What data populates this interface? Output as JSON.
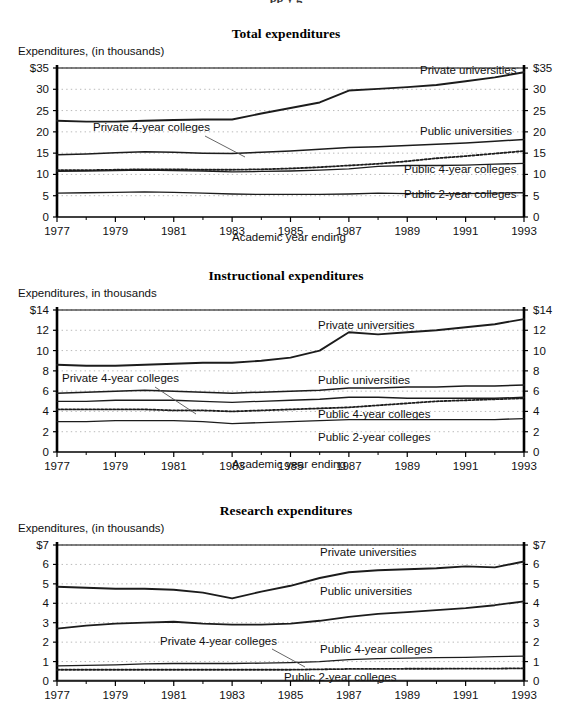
{
  "page": {
    "cut_title": "pp                                 y        g"
  },
  "series_names": {
    "priv_univ": "Private universities",
    "pub_univ": "Public universities",
    "priv4": "Private 4-year colleges",
    "pub4": "Public 4-year colleges",
    "pub2": "Public 2-year colleges"
  },
  "axis_label_x": "Academic year ending",
  "years": [
    1977,
    1978,
    1979,
    1980,
    1981,
    1982,
    1983,
    1984,
    1985,
    1986,
    1987,
    1988,
    1989,
    1990,
    1991,
    1992,
    1993
  ],
  "xticks": [
    "1977",
    "1979",
    "1981",
    "1983",
    "1985",
    "1987",
    "1989",
    "1991",
    "1993"
  ],
  "chart_data": [
    {
      "type": "line",
      "id": "total",
      "title": "Total expenditures",
      "ylabel": "Expenditures, (in thousands)",
      "xlabel": "Academic year ending",
      "x": [
        1977,
        1978,
        1979,
        1980,
        1981,
        1982,
        1983,
        1984,
        1985,
        1986,
        1987,
        1988,
        1989,
        1990,
        1991,
        1992,
        1993
      ],
      "ylim": [
        0,
        35
      ],
      "yticks": [
        0,
        5,
        10,
        15,
        20,
        25,
        30,
        35
      ],
      "ytick_labels_left": [
        "0",
        "5",
        "10",
        "15",
        "20",
        "25",
        "30",
        "$35"
      ],
      "ytick_labels_right": [
        "0",
        "5",
        "10",
        "15",
        "20",
        "25",
        "30",
        "$35"
      ],
      "grid": true,
      "dual_axis": true,
      "series": [
        {
          "name": "Private universities",
          "style": "solid",
          "width": 1.9,
          "values": [
            22.6,
            22.4,
            22.4,
            22.6,
            22.8,
            22.9,
            22.9,
            24.3,
            25.6,
            26.9,
            29.7,
            30.1,
            30.5,
            31.0,
            31.9,
            32.8,
            34.0
          ]
        },
        {
          "name": "Public universities",
          "style": "solid",
          "width": 1.5,
          "values": [
            14.6,
            14.8,
            15.1,
            15.3,
            15.2,
            15.0,
            14.9,
            15.2,
            15.5,
            15.9,
            16.3,
            16.5,
            16.8,
            17.1,
            17.4,
            17.8,
            18.2
          ]
        },
        {
          "name": "Private 4-year colleges",
          "style": "dotted",
          "width": 1.8,
          "values": [
            11.0,
            11.0,
            11.1,
            11.2,
            11.2,
            11.1,
            11.1,
            11.2,
            11.4,
            11.7,
            12.1,
            12.5,
            13.1,
            13.8,
            14.3,
            14.9,
            15.5
          ]
        },
        {
          "name": "Public 4-year colleges",
          "style": "solid",
          "width": 1.3,
          "values": [
            10.7,
            10.8,
            10.9,
            11.0,
            10.9,
            10.8,
            10.6,
            10.7,
            10.8,
            11.0,
            11.3,
            11.9,
            12.1,
            12.1,
            12.2,
            12.4,
            12.6
          ]
        },
        {
          "name": "Public 2-year colleges",
          "style": "solid",
          "width": 1.3,
          "values": [
            5.6,
            5.7,
            5.8,
            5.9,
            5.8,
            5.6,
            5.4,
            5.3,
            5.3,
            5.3,
            5.4,
            5.6,
            5.5,
            5.5,
            5.5,
            5.6,
            5.7
          ]
        }
      ],
      "annotations": [
        {
          "text": "Private universities",
          "x_px": 420,
          "y_px": 12,
          "anchor": "start"
        },
        {
          "text": "Public universities",
          "x_px": 420,
          "y_px": 73,
          "anchor": "start"
        },
        {
          "text": "Public 4-year colleges",
          "x_px": 404,
          "y_px": 111,
          "anchor": "start"
        },
        {
          "text": "Private 4-year colleges",
          "x_px": 93,
          "y_px": 69,
          "anchor": "start"
        },
        {
          "text": "Public 2-year colleges",
          "x_px": 404,
          "y_px": 136,
          "anchor": "start"
        }
      ]
    },
    {
      "type": "line",
      "id": "instructional",
      "title": "Instructional expenditures",
      "ylabel": "Expenditures, in thousands",
      "xlabel": "Academic year ending",
      "x": [
        1977,
        1978,
        1979,
        1980,
        1981,
        1982,
        1983,
        1984,
        1985,
        1986,
        1987,
        1988,
        1989,
        1990,
        1991,
        1992,
        1993
      ],
      "ylim": [
        0,
        14
      ],
      "yticks": [
        0,
        2,
        4,
        6,
        8,
        10,
        12,
        14
      ],
      "ytick_labels_left": [
        "0",
        "2",
        "4",
        "6",
        "8",
        "10",
        "12",
        "$14"
      ],
      "ytick_labels_right": [
        "0",
        "2",
        "4",
        "6",
        "8",
        "10",
        "12",
        "$14"
      ],
      "grid": true,
      "dual_axis": true,
      "series": [
        {
          "name": "Private universities",
          "style": "solid",
          "width": 1.9,
          "values": [
            8.6,
            8.5,
            8.5,
            8.6,
            8.7,
            8.8,
            8.8,
            9.0,
            9.3,
            10.0,
            11.8,
            11.6,
            11.8,
            12.0,
            12.3,
            12.6,
            13.1
          ]
        },
        {
          "name": "Public universities",
          "style": "solid",
          "width": 1.5,
          "values": [
            5.8,
            5.9,
            6.0,
            6.1,
            6.0,
            5.9,
            5.8,
            5.9,
            6.0,
            6.1,
            6.3,
            6.3,
            6.4,
            6.4,
            6.5,
            6.5,
            6.6
          ]
        },
        {
          "name": "Public 4-year colleges",
          "style": "solid",
          "width": 1.3,
          "values": [
            5.0,
            5.0,
            5.1,
            5.1,
            5.1,
            5.0,
            4.9,
            5.0,
            5.1,
            5.2,
            5.4,
            5.4,
            5.3,
            5.3,
            5.3,
            5.3,
            5.4
          ]
        },
        {
          "name": "Private 4-year colleges",
          "style": "dotted",
          "width": 1.8,
          "values": [
            4.2,
            4.2,
            4.2,
            4.2,
            4.1,
            4.1,
            4.0,
            4.1,
            4.2,
            4.3,
            4.4,
            4.6,
            4.8,
            5.0,
            5.1,
            5.2,
            5.3
          ]
        },
        {
          "name": "Public 2-year colleges",
          "style": "solid",
          "width": 1.3,
          "values": [
            3.0,
            3.0,
            3.1,
            3.1,
            3.1,
            3.0,
            2.8,
            2.9,
            3.0,
            3.1,
            3.2,
            3.2,
            3.2,
            3.2,
            3.2,
            3.2,
            3.3
          ]
        }
      ],
      "annotations": [
        {
          "text": "Private universities",
          "x_px": 318,
          "y_px": 25,
          "anchor": "start"
        },
        {
          "text": "Public universities",
          "x_px": 318,
          "y_px": 80,
          "anchor": "start"
        },
        {
          "text": "Public 4-year colleges",
          "x_px": 318,
          "y_px": 114,
          "anchor": "start"
        },
        {
          "text": "Private 4-year colleges",
          "x_px": 62,
          "y_px": 78,
          "anchor": "start"
        },
        {
          "text": "Public 2-year colleges",
          "x_px": 318,
          "y_px": 137,
          "anchor": "start"
        }
      ]
    },
    {
      "type": "line",
      "id": "research",
      "title": "Research expenditures",
      "ylabel": "Expenditures, (in thousands)",
      "xlabel": "",
      "x": [
        1977,
        1978,
        1979,
        1980,
        1981,
        1982,
        1983,
        1984,
        1985,
        1986,
        1987,
        1988,
        1989,
        1990,
        1991,
        1992,
        1993
      ],
      "ylim": [
        0,
        7
      ],
      "yticks": [
        0,
        1,
        2,
        3,
        4,
        5,
        6,
        7
      ],
      "ytick_labels_left": [
        "0",
        "1",
        "2",
        "3",
        "4",
        "5",
        "6",
        "$7"
      ],
      "ytick_labels_right": [
        "0",
        "1",
        "2",
        "3",
        "4",
        "5",
        "6",
        "$7"
      ],
      "grid": true,
      "dual_axis": true,
      "series": [
        {
          "name": "Private universities",
          "style": "solid",
          "width": 1.9,
          "values": [
            4.85,
            4.8,
            4.75,
            4.75,
            4.7,
            4.55,
            4.25,
            4.6,
            4.9,
            5.3,
            5.6,
            5.7,
            5.75,
            5.8,
            5.9,
            5.85,
            6.15
          ]
        },
        {
          "name": "Public universities",
          "style": "solid",
          "width": 1.8,
          "values": [
            2.7,
            2.85,
            2.95,
            3.0,
            3.05,
            2.95,
            2.9,
            2.9,
            2.95,
            3.1,
            3.3,
            3.45,
            3.55,
            3.65,
            3.75,
            3.9,
            4.1
          ]
        },
        {
          "name": "Public 4-year colleges",
          "style": "solid",
          "width": 1.3,
          "values": [
            0.78,
            0.8,
            0.83,
            0.88,
            0.9,
            0.9,
            0.9,
            0.92,
            0.95,
            1.0,
            1.1,
            1.15,
            1.18,
            1.2,
            1.22,
            1.25,
            1.28
          ]
        },
        {
          "name": "Private 4-year colleges",
          "style": "dotted",
          "width": 1.8,
          "values": [
            0.58,
            0.58,
            0.58,
            0.58,
            0.58,
            0.58,
            0.58,
            0.58,
            0.58,
            0.6,
            0.62,
            0.62,
            0.63,
            0.63,
            0.64,
            0.64,
            0.65
          ]
        },
        {
          "name": "Public 2-year colleges",
          "style": "solid",
          "width": 1.1,
          "values": [
            0.04,
            0.04,
            0.04,
            0.04,
            0.04,
            0.04,
            0.04,
            0.04,
            0.04,
            0.04,
            0.04,
            0.04,
            0.04,
            0.04,
            0.04,
            0.04,
            0.04
          ]
        }
      ],
      "annotations": [
        {
          "text": "Private universities",
          "x_px": 320,
          "y_px": 17,
          "anchor": "start"
        },
        {
          "text": "Public universities",
          "x_px": 320,
          "y_px": 56,
          "anchor": "start"
        },
        {
          "text": "Public 4-year colleges",
          "x_px": 320,
          "y_px": 114,
          "anchor": "start"
        },
        {
          "text": "Private 4-year colleges",
          "x_px": 160,
          "y_px": 106,
          "anchor": "start"
        },
        {
          "text": "Public 2-year colleges",
          "x_px": 284,
          "y_px": 142,
          "anchor": "start"
        }
      ]
    }
  ],
  "colors": {
    "line": "#1c1c1c",
    "grid": "#b9b9b9",
    "axis": "#000000",
    "text": "#111111"
  }
}
